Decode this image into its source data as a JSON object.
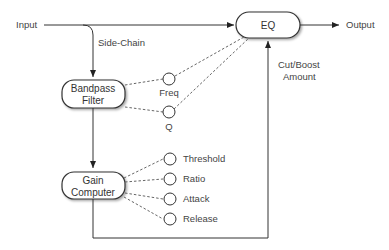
{
  "diagram": {
    "io": {
      "input": "Input",
      "output": "Output"
    },
    "labels": {
      "side_chain": "Side-Chain",
      "cut_boost_line1": "Cut/Boost",
      "cut_boost_line2": "Amount"
    },
    "blocks": {
      "eq": {
        "label": "EQ"
      },
      "bandpass": {
        "line1": "Bandpass",
        "line2": "Filter"
      },
      "gain": {
        "line1": "Gain",
        "line2": "Computer"
      }
    },
    "bandpass_params": [
      "Freq",
      "Q"
    ],
    "gain_params": [
      "Threshold",
      "Ratio",
      "Attack",
      "Release"
    ]
  }
}
